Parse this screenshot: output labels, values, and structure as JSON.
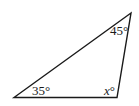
{
  "diagram": {
    "type": "triangle",
    "vertices": {
      "bottom_left": [
        14,
        97.5
      ],
      "top_right": [
        131,
        13
      ],
      "bottom_right": [
        117,
        97.5
      ]
    },
    "stroke_color": "#1a1a1a",
    "angles": [
      {
        "vertex": "bottom_left",
        "label": "35°"
      },
      {
        "vertex": "top_right",
        "label": "45°"
      },
      {
        "vertex": "bottom_right",
        "label_var": "x",
        "label_deg": "°"
      }
    ]
  }
}
